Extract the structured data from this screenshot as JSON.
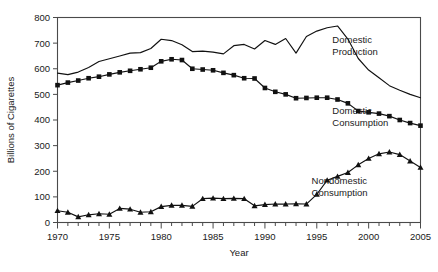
{
  "chart_data": {
    "type": "line",
    "title": "",
    "xlabel": "Year",
    "ylabel": "Billions of Cigarettes",
    "xlim": [
      1970,
      2005
    ],
    "ylim": [
      0,
      800
    ],
    "grid": false,
    "legend_position": "inline-annotations",
    "x_ticklabels": [
      "1970",
      "1975",
      "1980",
      "1985",
      "1990",
      "1995",
      "2000",
      "2005"
    ],
    "x_ticks": [
      1970,
      1975,
      1980,
      1985,
      1990,
      1995,
      2000,
      2005
    ],
    "x_minor_tick_interval": 1,
    "y_ticklabels": [
      "0",
      "100",
      "200",
      "300",
      "400",
      "500",
      "600",
      "700",
      "800"
    ],
    "y_ticks": [
      0,
      100,
      200,
      300,
      400,
      500,
      600,
      700,
      800
    ],
    "x": [
      1970,
      1971,
      1972,
      1973,
      1974,
      1975,
      1976,
      1977,
      1978,
      1979,
      1980,
      1981,
      1982,
      1983,
      1984,
      1985,
      1986,
      1987,
      1988,
      1989,
      1990,
      1991,
      1992,
      1993,
      1994,
      1995,
      1996,
      1997,
      1998,
      1999,
      2000,
      2001,
      2002,
      2003,
      2004,
      2005
    ],
    "series": [
      {
        "name": "Domestic Production",
        "marker": "none",
        "values": [
          583,
          577,
          587,
          605,
          628,
          639,
          650,
          661,
          663,
          679,
          715,
          710,
          694,
          667,
          669,
          665,
          658,
          690,
          695,
          677,
          710,
          695,
          718,
          661,
          726,
          747,
          760,
          767,
          716,
          640,
          595,
          565,
          534,
          516,
          500,
          487
        ]
      },
      {
        "name": "Domestic Consumption",
        "marker": "square",
        "values": [
          536,
          546,
          554,
          563,
          569,
          578,
          586,
          592,
          598,
          604,
          629,
          637,
          634,
          600,
          597,
          594,
          584,
          575,
          563,
          562,
          525,
          510,
          500,
          485,
          486,
          487,
          487,
          480,
          465,
          435,
          430,
          425,
          415,
          400,
          388,
          378
        ]
      },
      {
        "name": "Nondomestic Consumption",
        "marker": "triangle",
        "values": [
          46,
          40,
          22,
          30,
          34,
          32,
          55,
          52,
          40,
          42,
          62,
          67,
          67,
          63,
          93,
          95,
          93,
          94,
          93,
          65,
          70,
          72,
          72,
          73,
          72,
          110,
          165,
          180,
          195,
          225,
          250,
          268,
          275,
          265,
          240,
          215
        ]
      }
    ],
    "annotations": [
      {
        "text_line1": "Domestic",
        "text_line2": "Production",
        "x": 1996.5,
        "y": 700
      },
      {
        "text_line1": "Domestic",
        "text_line2": "Consumption",
        "x": 1996.5,
        "y": 425
      },
      {
        "text_line1": "Nondomestic",
        "text_line2": "Consumption",
        "x": 1994.5,
        "y": 150
      }
    ]
  }
}
